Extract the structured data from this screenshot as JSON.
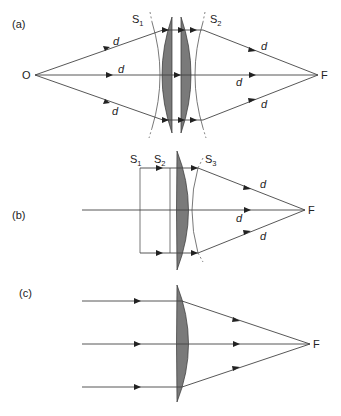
{
  "panels": [
    {
      "label": "(a)",
      "source_label": "O",
      "focus_label": "F",
      "surfaces": [
        {
          "base": "S",
          "sub": "1"
        },
        {
          "base": "S",
          "sub": "2"
        }
      ],
      "path_labels": [
        "d",
        "d",
        "d",
        "d",
        "d",
        "d"
      ],
      "description": "Point source O imaged to F through two plano-convex lenses; equal optical path d along all rays"
    },
    {
      "label": "(b)",
      "focus_label": "F",
      "surfaces": [
        {
          "base": "S",
          "sub": "1"
        },
        {
          "base": "S",
          "sub": "2"
        },
        {
          "base": "S",
          "sub": "3"
        }
      ],
      "path_labels": [
        "d",
        "d",
        "d"
      ],
      "description": "Collimated beam through plano-convex lens focused at F; equal optical paths d"
    },
    {
      "label": "(c)",
      "focus_label": "F",
      "description": "Parallel rays through plano-convex lens converge at F"
    }
  ],
  "colors": {
    "lens_fill": "#7a7a7a",
    "line": "#444444",
    "background": "#ffffff"
  }
}
